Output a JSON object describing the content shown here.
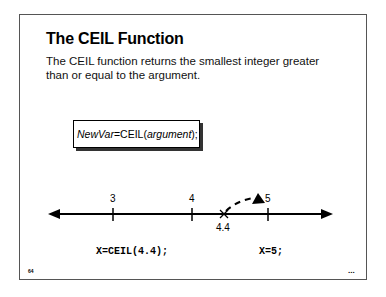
{
  "slide": {
    "title": "The CEIL Function",
    "description": "The CEIL function returns the smallest integer greater than or equal to the argument.",
    "syntax": {
      "var": "NewVar",
      "eq_func": "=CEIL(",
      "arg": "argument",
      "close": ");"
    },
    "number_line": {
      "ticks": [
        {
          "label": "3",
          "value": 3
        },
        {
          "label": "4",
          "value": 4
        },
        {
          "label": "5",
          "value": 5
        }
      ],
      "marker": {
        "label": "4.4",
        "value": 4.4,
        "symbol": "x-mark"
      },
      "arrow_from": 4.4,
      "arrow_to": 5
    },
    "code_left": "X=CEIL(4.4);",
    "code_right": "X=5;",
    "page_number": "64",
    "more_indicator": "..."
  }
}
